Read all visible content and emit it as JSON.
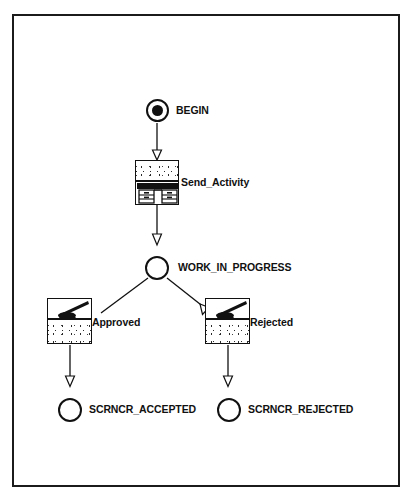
{
  "diagram": {
    "type": "workflow-state-diagram",
    "title": "",
    "frame": {
      "border_color": "#1b1b1b",
      "background": "#ffffff"
    },
    "nodes": [
      {
        "id": "begin",
        "label": "BEGIN",
        "kind": "start-state",
        "shape": "circle-with-dot",
        "icon": "start-state-icon",
        "x": 157,
        "y": 110,
        "label_x": 176,
        "label_y": 104
      },
      {
        "id": "send_activity",
        "label": "Send_Activity",
        "kind": "activity",
        "shape": "activity-box",
        "icon": "desk-activity-icon",
        "x": 157,
        "y": 182,
        "label_x": 180,
        "label_y": 176
      },
      {
        "id": "work_in_progress",
        "label": "WORK_IN_PROGRESS",
        "kind": "state",
        "shape": "circle",
        "icon": "state-circle-icon",
        "x": 157,
        "y": 268,
        "label_x": 177,
        "label_y": 261
      },
      {
        "id": "approved",
        "label": "Approved",
        "kind": "activity",
        "shape": "activity-box",
        "icon": "signing-hand-icon",
        "x": 68,
        "y": 321,
        "label_x": 91,
        "label_y": 316
      },
      {
        "id": "rejected",
        "label": "Rejected",
        "kind": "activity",
        "shape": "activity-box",
        "icon": "signing-hand-icon",
        "x": 224,
        "y": 321,
        "label_x": 247,
        "label_y": 316
      },
      {
        "id": "scrncr_accepted",
        "label": "SCRNCR_ACCEPTED",
        "kind": "state",
        "shape": "circle",
        "icon": "state-circle-icon",
        "x": 70,
        "y": 410,
        "label_x": 89,
        "label_y": 403
      },
      {
        "id": "scrncr_rejected",
        "label": "SCRNCR_REJECTED",
        "kind": "state",
        "shape": "circle",
        "icon": "state-circle-icon",
        "x": 230,
        "y": 410,
        "label_x": 248,
        "label_y": 403
      }
    ],
    "edges": [
      {
        "id": "e1",
        "from": "begin",
        "to": "send_activity",
        "arrowhead": "hollow-triangle"
      },
      {
        "id": "e2",
        "from": "send_activity",
        "to": "work_in_progress",
        "arrowhead": "hollow-triangle"
      },
      {
        "id": "e3",
        "from": "work_in_progress",
        "to": "approved",
        "arrowhead": "none"
      },
      {
        "id": "e4",
        "from": "work_in_progress",
        "to": "rejected",
        "arrowhead": "hollow-triangle"
      },
      {
        "id": "e5",
        "from": "approved",
        "to": "scrncr_accepted",
        "arrowhead": "hollow-triangle"
      },
      {
        "id": "e6",
        "from": "rejected",
        "to": "scrncr_rejected",
        "arrowhead": "hollow-triangle"
      }
    ],
    "colors": {
      "stroke": "#111111",
      "fill": "#ffffff",
      "icon_dark": "#111111",
      "frame": "#1b1b1b"
    }
  }
}
